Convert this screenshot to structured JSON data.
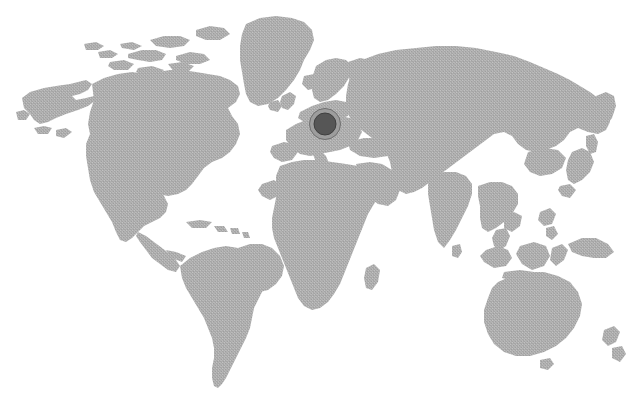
{
  "map": {
    "title": "World Map",
    "projection": "equirectangular",
    "background_color": "#ffffff",
    "land_color": "#a8a8a8",
    "land_texture": "halftone-dither",
    "land_texture_light": "#c4c4c4",
    "land_texture_dark": "#9a9a9a",
    "antarctica_visible": false,
    "labels_visible": false,
    "graticule_visible": false,
    "regions": [
      {
        "name": "north-america"
      },
      {
        "name": "greenland"
      },
      {
        "name": "central-america"
      },
      {
        "name": "caribbean"
      },
      {
        "name": "south-america"
      },
      {
        "name": "europe"
      },
      {
        "name": "british-isles"
      },
      {
        "name": "scandinavia"
      },
      {
        "name": "africa"
      },
      {
        "name": "madagascar"
      },
      {
        "name": "middle-east"
      },
      {
        "name": "russia-asia"
      },
      {
        "name": "india"
      },
      {
        "name": "sri-lanka"
      },
      {
        "name": "southeast-asia"
      },
      {
        "name": "japan"
      },
      {
        "name": "indonesia"
      },
      {
        "name": "philippines"
      },
      {
        "name": "new-guinea"
      },
      {
        "name": "australia"
      },
      {
        "name": "new-zealand"
      },
      {
        "name": "iceland"
      }
    ]
  },
  "marker": {
    "label": "",
    "region_hint": "central-europe",
    "x": 325,
    "y": 124,
    "ring_diameter": 30,
    "core_diameter": 21,
    "ring_color": "#9d9d9d",
    "ring_border_color": "#6f6f6f",
    "core_color": "#565656",
    "core_border_color": "#3f3f3f"
  }
}
